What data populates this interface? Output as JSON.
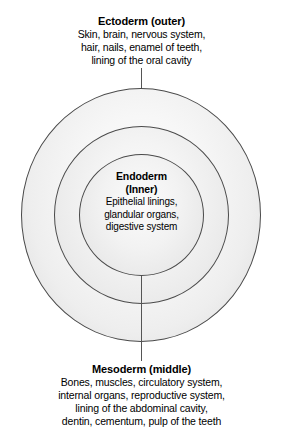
{
  "diagram": {
    "background_color": "#ffffff",
    "outline_color": "#4a4a4a",
    "leader_line_color": "#555555",
    "layers": {
      "ectoderm": {
        "title": "Ectoderm (outer)",
        "lines": [
          "Skin, brain, nervous system,",
          "hair, nails, enamel of teeth,",
          "lining of the oral cavity"
        ]
      },
      "endoderm": {
        "title_line_1": "Endoderm",
        "title_line_2": "(Inner)",
        "lines": [
          "Epithelial linings,",
          "glandular organs,",
          "digestive system"
        ]
      },
      "mesoderm": {
        "title": "Mesoderm (middle)",
        "lines": [
          "Bones, muscles, circulatory system,",
          "internal organs, reproductive system,",
          "lining of the abdominal cavity,",
          "dentin, cementum, pulp of the teeth"
        ]
      }
    }
  }
}
